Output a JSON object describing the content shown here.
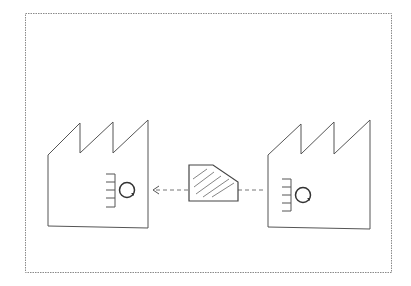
{
  "diagram": {
    "type": "value-stream-map",
    "frame": {
      "x": 25,
      "y": 13,
      "width": 366,
      "height": 259,
      "style": "dotted"
    },
    "nodes": [
      {
        "id": "customer-factory",
        "icon": "factory-icon",
        "position": "left",
        "has_process_icon": true
      },
      {
        "id": "part",
        "icon": "hatched-part-icon",
        "position": "center"
      },
      {
        "id": "supplier-factory",
        "icon": "factory-icon",
        "position": "right",
        "has_process_icon": true
      }
    ],
    "edges": [
      {
        "from": "supplier-factory",
        "to": "customer-factory",
        "via": "part",
        "style": "dashed",
        "arrow": "left"
      }
    ],
    "colors": {
      "line": "#555555",
      "frame": "#8a8a8a",
      "background": "#ffffff"
    }
  }
}
